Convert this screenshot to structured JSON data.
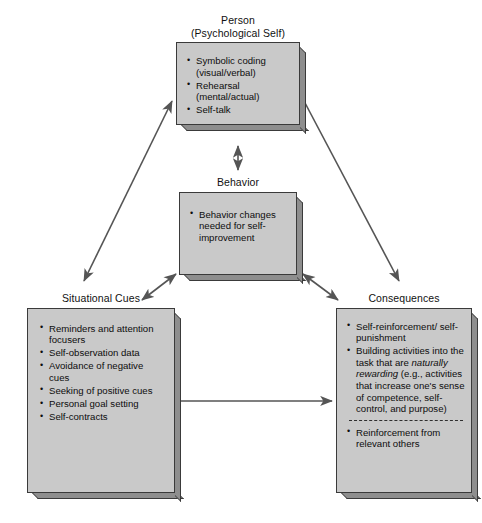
{
  "diagram": {
    "fill_color": "#c9c9c9",
    "edge_color": "#8e8e8e",
    "line_color": "#555555",
    "nodes": {
      "person": {
        "label": "Person\n(Psychological Self)",
        "items": [
          "Symbolic coding (visual/verbal)",
          "Rehearsal (mental/actual)",
          "Self-talk"
        ]
      },
      "behavior": {
        "label": "Behavior",
        "items": [
          "Behavior changes needed for self-improvement"
        ]
      },
      "situational_cues": {
        "label": "Situational Cues",
        "items": [
          "Reminders and attention focusers",
          "Self-observation data",
          "Avoidance of negative cues",
          "Seeking of positive cues",
          "Personal goal setting",
          "Self-contracts"
        ]
      },
      "consequences": {
        "label": "Consequences",
        "items_top": [
          "Self-reinforcement/ self-punishment",
          "Building activities into the task that are naturally rewarding (e.g., activities that increase one's sense of competence, self-control, and purpose)"
        ],
        "items_bottom": [
          "Reinforcement from relevant others"
        ]
      }
    },
    "connectors": [
      {
        "name": "person-behavior",
        "from": "person",
        "to": "behavior",
        "style": "double-headed",
        "orientation": "vertical"
      },
      {
        "name": "person-situational-cues",
        "from": "person",
        "to": "situational_cues",
        "style": "double-headed",
        "orientation": "diagonal"
      },
      {
        "name": "person-consequences",
        "from": "person",
        "to": "consequences",
        "style": "single-headed",
        "orientation": "diagonal"
      },
      {
        "name": "behavior-situational-cues",
        "from": "behavior",
        "to": "situational_cues",
        "style": "double-headed",
        "orientation": "diagonal"
      },
      {
        "name": "behavior-consequences",
        "from": "behavior",
        "to": "consequences",
        "style": "double-headed",
        "orientation": "diagonal"
      },
      {
        "name": "situational-cues-consequences",
        "from": "situational_cues",
        "to": "consequences",
        "style": "double-headed",
        "orientation": "horizontal"
      }
    ]
  }
}
